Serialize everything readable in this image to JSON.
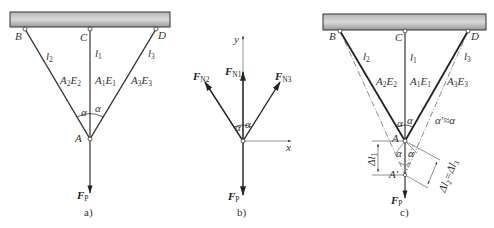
{
  "figure": {
    "panels": [
      {
        "id": "a",
        "caption": "a)",
        "points": {
          "B": "B",
          "C": "C",
          "D": "D",
          "A": "A"
        },
        "bars": [
          {
            "length": "l",
            "length_sub": "2",
            "prop_a": "A",
            "prop_a_sub": "2",
            "prop_e": "E",
            "prop_e_sub": "2"
          },
          {
            "length": "l",
            "length_sub": "1",
            "prop_a": "A",
            "prop_a_sub": "1",
            "prop_e": "E",
            "prop_e_sub": "1"
          },
          {
            "length": "l",
            "length_sub": "3",
            "prop_a": "A",
            "prop_a_sub": "3",
            "prop_e": "E",
            "prop_e_sub": "3"
          }
        ],
        "angle_label": "α",
        "load": {
          "symbol": "F",
          "sub": "P"
        }
      },
      {
        "id": "b",
        "caption": "b)",
        "axes": {
          "x": "x",
          "y": "y"
        },
        "forces": [
          {
            "symbol": "F",
            "sub": "N2"
          },
          {
            "symbol": "F",
            "sub": "N1"
          },
          {
            "symbol": "F",
            "sub": "N3"
          }
        ],
        "angle_label": "α",
        "load": {
          "symbol": "F",
          "sub": "P"
        }
      },
      {
        "id": "c",
        "caption": "c)",
        "points": {
          "B": "B",
          "C": "C",
          "D": "D",
          "A": "A",
          "A_prime": "A′"
        },
        "bars": [
          {
            "length": "l",
            "length_sub": "2",
            "prop_a": "A",
            "prop_a_sub": "2",
            "prop_e": "E",
            "prop_e_sub": "2"
          },
          {
            "length": "l",
            "length_sub": "1",
            "prop_a": "A",
            "prop_a_sub": "1",
            "prop_e": "E",
            "prop_e_sub": "1"
          },
          {
            "length": "l",
            "length_sub": "3",
            "prop_a": "A",
            "prop_a_sub": "3",
            "prop_e": "E",
            "prop_e_sub": "3"
          }
        ],
        "angle_label": "α",
        "angle_relation": "α′≈α",
        "delta_l1": {
          "symbol": "Δl",
          "sub": "1"
        },
        "delta_relation": {
          "lhs": "Δl",
          "lhs_sub": "2",
          "op": "=",
          "rhs": "Δl",
          "rhs_sub": "3"
        },
        "load": {
          "symbol": "F",
          "sub": "P"
        }
      }
    ]
  }
}
